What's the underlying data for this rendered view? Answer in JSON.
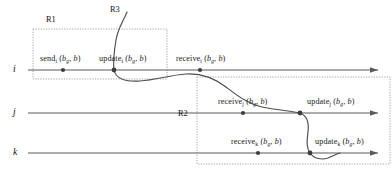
{
  "figure": {
    "type": "distributed-system-timeline-diagram",
    "background_color": "#ffffff",
    "line_color": "#4d4d4d",
    "dot_color": "#3d3d3d",
    "region_border_color": "#8c8c8c",
    "text_color": "#1a1a1a"
  },
  "processes": [
    {
      "id": "i",
      "label": "i",
      "line_y": 70
    },
    {
      "id": "j",
      "label": "j",
      "line_y": 113
    },
    {
      "id": "k",
      "label": "k",
      "line_y": 153
    }
  ],
  "regions": [
    {
      "id": "R1",
      "label": "R1",
      "x": 33,
      "y": 29,
      "width": 134,
      "height": 50,
      "label_x": 46,
      "label_y": 16
    },
    {
      "id": "R2",
      "label": "R2",
      "x": 197,
      "y": 77,
      "width": 193,
      "height": 87,
      "label_x": 178,
      "label_y": 110
    },
    {
      "id": "R3",
      "label": "R3",
      "label_x": 110,
      "label_y": 6
    }
  ],
  "events": [
    {
      "id": "send-i",
      "process": "i",
      "name": "send",
      "subscript": "i",
      "args": "(b_g, b)",
      "arg_first": "b",
      "arg_first_sub": "g",
      "arg_second": "b",
      "dot_x": 63,
      "dot_y": 70,
      "label_x": 40,
      "label_y": 55
    },
    {
      "id": "update-i",
      "process": "i",
      "name": "update",
      "subscript": "i",
      "args": "(b_g, b)",
      "arg_first": "b",
      "arg_first_sub": "g",
      "arg_second": "b",
      "dot_x": 114,
      "dot_y": 70,
      "label_x": 99,
      "label_y": 55
    },
    {
      "id": "receive-i",
      "process": "i",
      "name": "receive",
      "subscript": "i",
      "args": "(b_g, b)",
      "arg_first": "b",
      "arg_first_sub": "g",
      "arg_second": "b",
      "dot_x": 200,
      "dot_y": 70,
      "label_x": 176,
      "label_y": 55
    },
    {
      "id": "receive-j",
      "process": "j",
      "name": "receive",
      "subscript": "j",
      "args": "(b_g, b)",
      "arg_first": "b",
      "arg_first_sub": "g",
      "arg_second": "b",
      "dot_x": 243,
      "dot_y": 113,
      "label_x": 218,
      "label_y": 98
    },
    {
      "id": "update-j",
      "process": "j",
      "name": "update",
      "subscript": "j",
      "args": "(b_g, b)",
      "arg_first": "b",
      "arg_first_sub": "g",
      "arg_second": "b",
      "dot_x": 300,
      "dot_y": 113,
      "label_x": 307,
      "label_y": 98
    },
    {
      "id": "receive-k",
      "process": "k",
      "name": "receive",
      "subscript": "k",
      "args": "(b_g, b)",
      "arg_first": "b",
      "arg_first_sub": "g",
      "arg_second": "b",
      "dot_x": 258,
      "dot_y": 153,
      "label_x": 231,
      "label_y": 138
    },
    {
      "id": "update-k",
      "process": "k",
      "name": "update",
      "subscript": "k",
      "args": "(b_g, b)",
      "arg_first": "b",
      "arg_first_sub": "g",
      "arg_second": "b",
      "dot_x": 310,
      "dot_y": 153,
      "label_x": 315,
      "label_y": 138
    }
  ],
  "cut_line": {
    "description": "wavy consistent-cut curve crossing processes i, j and k",
    "stroke": "#4d4d4d"
  }
}
